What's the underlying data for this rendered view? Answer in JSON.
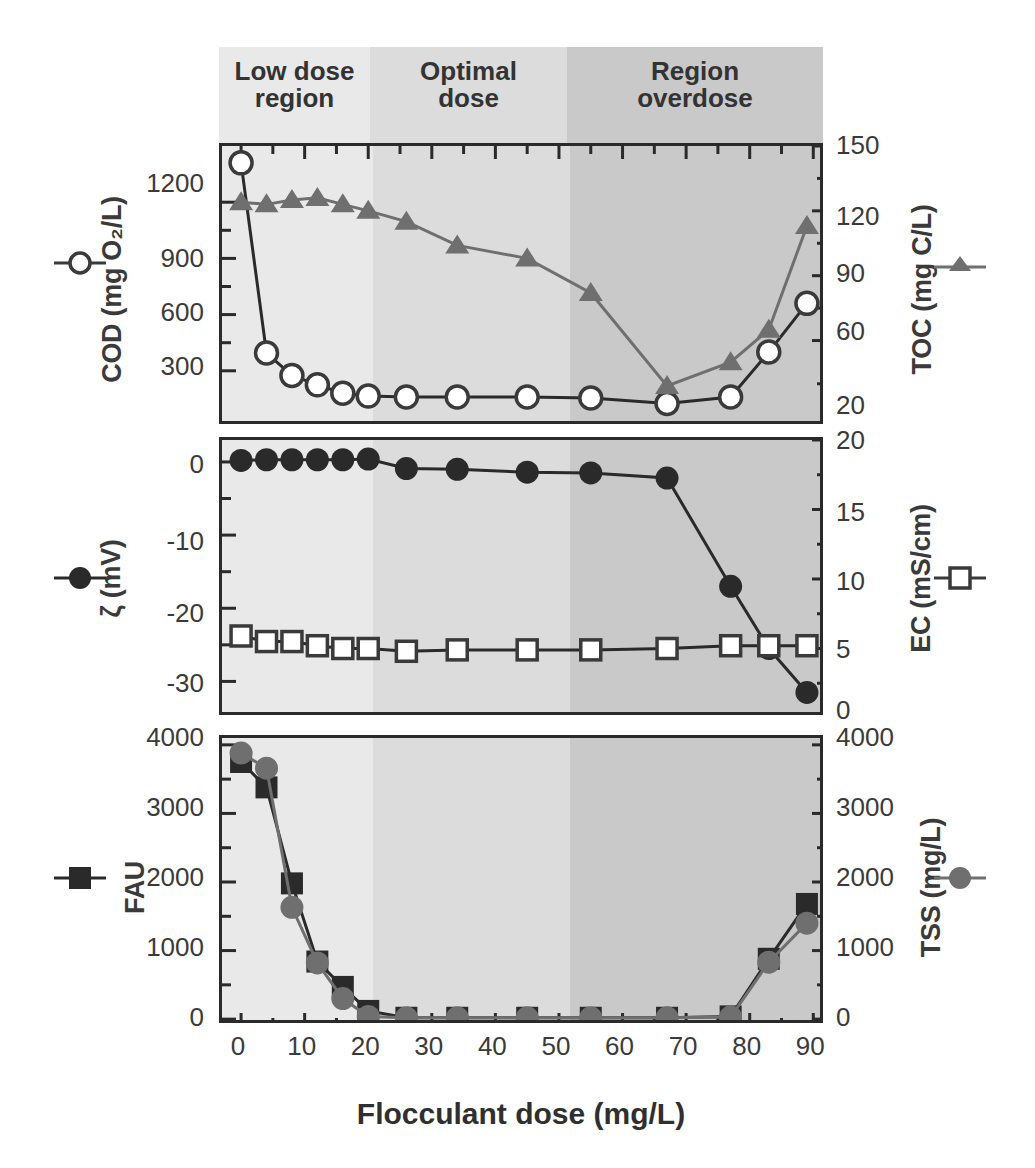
{
  "figure": {
    "xtitle": "Flocculant dose (mg/L)",
    "regions": [
      {
        "key": "low",
        "label": "Low dose\nregion",
        "x_start": 0,
        "x_end": 24,
        "shade": "#e9e9e9"
      },
      {
        "key": "optimal",
        "label": "Optimal\ndose",
        "x_start": 24,
        "x_end": 67,
        "shade": "#dcdcdc"
      },
      {
        "key": "overdose",
        "label": "Region\noverdose",
        "x_start": 67,
        "x_end": 90,
        "shade": "#c9c9c9"
      }
    ],
    "xaxis": {
      "label": "Flocculant dose (mg/L)",
      "ticks": [
        0,
        10,
        20,
        30,
        40,
        50,
        60,
        70,
        80,
        90
      ],
      "min": -3,
      "max": 92
    },
    "axis_titles": {
      "cod": "COD (mg O₂/L)",
      "toc": "TOC (mg C/L)",
      "zeta": "ζ  (mV)",
      "ec": "EC (mS/cm)",
      "fau": "FAU",
      "tss": "TSS (mg/L)"
    },
    "legend": [
      {
        "key": "cod",
        "marker": "open-circle",
        "side": "left",
        "panel": 1
      },
      {
        "key": "toc",
        "marker": "filled-triangle",
        "side": "right",
        "panel": 1
      },
      {
        "key": "zeta",
        "marker": "filled-circle",
        "side": "left",
        "panel": 2
      },
      {
        "key": "ec",
        "marker": "open-square",
        "side": "right",
        "panel": 2
      },
      {
        "key": "fau",
        "marker": "filled-square",
        "side": "left",
        "panel": 3
      },
      {
        "key": "tss",
        "marker": "filled-circle-gray",
        "side": "right",
        "panel": 3
      }
    ],
    "colors": {
      "ink": "#2a2a2a",
      "gray_marker": "#6f6f6f",
      "band_low": "#e9e9e9",
      "band_optimal": "#dcdcdc",
      "band_overdose": "#c9c9c9"
    }
  },
  "chart_data": [
    {
      "type": "line",
      "panel": 1,
      "title": "",
      "xlabel": "Flocculant dose (mg/L)",
      "ylabel": "COD (mg O2/L)",
      "y2label": "TOC (mg C/L)",
      "xlim": [
        -3,
        92
      ],
      "ylim": [
        0,
        1500
      ],
      "yticks": [
        300,
        600,
        900,
        1200
      ],
      "y2lim": [
        20,
        150
      ],
      "y2ticks": [
        20,
        60,
        90,
        120,
        150
      ],
      "grid": false,
      "legend": "external-left-right",
      "series": [
        {
          "name": "COD",
          "axis": "left",
          "marker": "open-circle",
          "x": [
            0,
            4,
            8,
            12,
            16,
            20,
            26,
            34,
            45,
            55,
            67,
            77,
            83,
            89
          ],
          "values": [
            1410,
            395,
            275,
            225,
            180,
            165,
            160,
            160,
            160,
            155,
            125,
            160,
            400,
            660
          ]
        },
        {
          "name": "TOC",
          "axis": "right",
          "marker": "filled-triangle",
          "x": [
            0,
            4,
            8,
            12,
            16,
            20,
            26,
            34,
            45,
            55,
            67,
            77,
            83,
            89
          ],
          "values": [
            124,
            123,
            125,
            126,
            123,
            120,
            115,
            104,
            98,
            82,
            39,
            50,
            65,
            113
          ]
        }
      ]
    },
    {
      "type": "line",
      "panel": 2,
      "xlabel": "Flocculant dose (mg/L)",
      "ylabel": "zeta (mV)",
      "y2label": "EC (mS/cm)",
      "xlim": [
        -3,
        92
      ],
      "ylim": [
        -35,
        3
      ],
      "yticks": [
        0,
        -10,
        -20,
        -30
      ],
      "y2lim": [
        0,
        20
      ],
      "y2ticks": [
        0,
        5,
        10,
        15,
        20
      ],
      "grid": false,
      "series": [
        {
          "name": "Zeta potential",
          "axis": "left",
          "marker": "filled-circle",
          "x": [
            0,
            4,
            8,
            12,
            16,
            20,
            26,
            34,
            45,
            55,
            67,
            77,
            83,
            89
          ],
          "values": [
            0.2,
            0.3,
            0.3,
            0.3,
            0.3,
            0.4,
            -0.9,
            -1.0,
            -1.4,
            -1.5,
            -2.2,
            -17.0,
            -25.5,
            -31.5
          ]
        },
        {
          "name": "EC",
          "axis": "right",
          "marker": "open-square",
          "x": [
            0,
            4,
            8,
            12,
            16,
            20,
            26,
            34,
            45,
            55,
            67,
            77,
            83,
            89
          ],
          "values": [
            5.9,
            5.5,
            5.5,
            5.2,
            5.0,
            5.0,
            4.8,
            4.9,
            4.9,
            4.9,
            5.0,
            5.2,
            5.2,
            5.2
          ]
        }
      ]
    },
    {
      "type": "line",
      "panel": 3,
      "xlabel": "Flocculant dose (mg/L)",
      "ylabel": "FAU",
      "y2label": "TSS (mg/L)",
      "xlim": [
        -3,
        92
      ],
      "ylim": [
        -100,
        4100
      ],
      "yticks": [
        0,
        1000,
        2000,
        3000,
        4000
      ],
      "y2lim": [
        -100,
        4100
      ],
      "y2ticks": [
        0,
        1000,
        2000,
        3000,
        4000
      ],
      "grid": false,
      "series": [
        {
          "name": "FAU",
          "axis": "left",
          "marker": "filled-square",
          "x": [
            0,
            4,
            8,
            12,
            16,
            20,
            26,
            34,
            45,
            55,
            67,
            77,
            83,
            89
          ],
          "values": [
            3750,
            3380,
            1980,
            840,
            470,
            120,
            20,
            20,
            20,
            20,
            20,
            40,
            880,
            1680
          ]
        },
        {
          "name": "TSS",
          "axis": "right",
          "marker": "filled-circle-gray",
          "x": [
            0,
            4,
            8,
            12,
            16,
            20,
            26,
            34,
            45,
            55,
            67,
            77,
            83,
            89
          ],
          "values": [
            3880,
            3660,
            1630,
            820,
            300,
            40,
            20,
            20,
            20,
            20,
            20,
            30,
            830,
            1400
          ]
        }
      ]
    }
  ]
}
